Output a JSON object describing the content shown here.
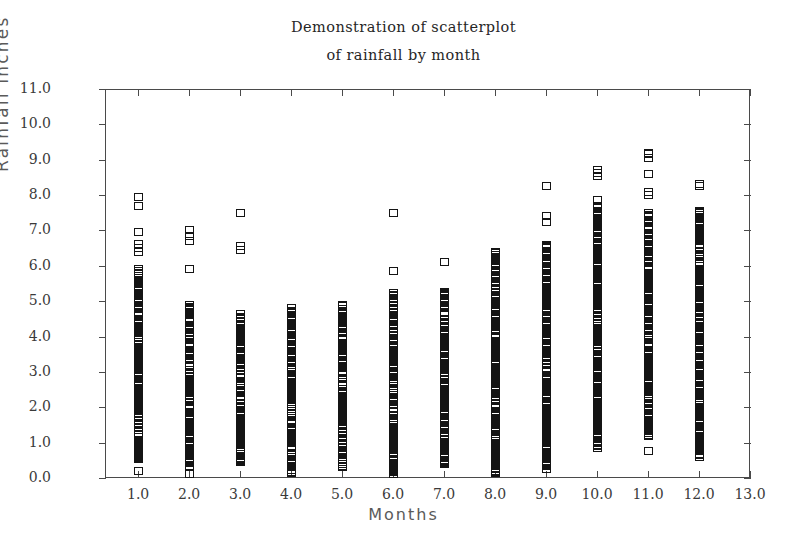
{
  "title": {
    "line1": "Demonstration of scatterplot",
    "line2": "of rainfall by month"
  },
  "axes": {
    "x_title": "Months",
    "y_title": "Rainfall inches",
    "x_ticks": [
      "1.0",
      "2.0",
      "3.0",
      "4.0",
      "5.0",
      "6.0",
      "7.0",
      "8.0",
      "9.0",
      "10.0",
      "11.0",
      "12.0",
      "13.0"
    ],
    "y_ticks": [
      "0.0",
      "1.0",
      "2.0",
      "3.0",
      "4.0",
      "5.0",
      "6.0",
      "7.0",
      "8.0",
      "9.0",
      "10.0",
      "11.0"
    ]
  },
  "style": {
    "marker": "open-square",
    "marker_color": "#141414",
    "axis_color": "#4a4a4a",
    "background": "#ffffff",
    "text_color": "#262626"
  },
  "chart_data": {
    "type": "scatter",
    "title": "Demonstration of scatterplot of rainfall by month",
    "xlabel": "Months",
    "ylabel": "Rainfall inches",
    "xlim": [
      0.35,
      13.0
    ],
    "ylim": [
      0.0,
      11.0
    ],
    "xticks": [
      1,
      2,
      3,
      4,
      5,
      6,
      7,
      8,
      9,
      10,
      11,
      12,
      13
    ],
    "yticks": [
      0,
      1,
      2,
      3,
      4,
      5,
      6,
      7,
      8,
      9,
      10,
      11
    ],
    "grid": false,
    "legend": null,
    "marker": "open-square",
    "series": [
      {
        "name": "Rainfall observations",
        "points_by_month": [
          {
            "month": 1,
            "n": 60,
            "min": 0.2,
            "max": 8.0,
            "dense_range": [
              0.5,
              5.9
            ],
            "values": [
              0.2,
              0.55,
              0.62,
              0.7,
              0.78,
              0.85,
              1.15,
              1.35,
              1.5,
              1.6,
              1.72,
              1.8,
              1.9,
              2.0,
              2.1,
              2.2,
              2.28,
              2.35,
              2.45,
              2.55,
              2.62,
              2.7,
              2.8,
              2.88,
              2.95,
              3.05,
              3.12,
              3.2,
              3.3,
              3.38,
              3.45,
              3.52,
              3.6,
              3.7,
              3.78,
              3.85,
              3.95,
              4.05,
              4.12,
              4.2,
              4.3,
              4.38,
              4.48,
              4.6,
              4.7,
              4.85,
              4.95,
              5.05,
              5.2,
              5.35,
              5.5,
              5.65,
              5.8,
              5.9,
              6.4,
              6.5,
              6.62,
              6.95,
              7.7,
              7.95
            ]
          },
          {
            "month": 2,
            "n": 57,
            "min": 0.1,
            "max": 7.0,
            "dense_range": [
              0.3,
              4.9
            ],
            "values": [
              0.1,
              0.32,
              0.42,
              0.5,
              0.62,
              0.75,
              0.9,
              1.0,
              1.1,
              1.2,
              1.3,
              1.42,
              1.55,
              1.65,
              1.75,
              1.85,
              1.95,
              2.05,
              2.15,
              2.25,
              2.32,
              2.42,
              2.5,
              2.6,
              2.7,
              2.8,
              2.88,
              2.95,
              3.05,
              3.15,
              3.25,
              3.35,
              3.45,
              3.52,
              3.6,
              3.7,
              3.8,
              3.9,
              4.0,
              4.1,
              4.2,
              4.3,
              4.4,
              4.5,
              4.6,
              4.7,
              4.8,
              4.9,
              5.9,
              6.7,
              6.85,
              7.0,
              1.48,
              2.2,
              3.0,
              3.9,
              4.45
            ]
          },
          {
            "month": 3,
            "n": 48,
            "min": 0.45,
            "max": 7.5,
            "dense_range": [
              0.45,
              4.65
            ],
            "values": [
              0.45,
              0.55,
              0.68,
              0.8,
              0.92,
              1.05,
              1.2,
              1.35,
              1.5,
              1.62,
              1.75,
              1.88,
              2.0,
              2.12,
              2.22,
              2.32,
              2.45,
              2.55,
              2.65,
              2.75,
              2.85,
              2.95,
              3.05,
              3.15,
              3.25,
              3.35,
              3.45,
              3.55,
              3.65,
              3.75,
              3.85,
              3.92,
              4.05,
              4.15,
              4.25,
              4.35,
              4.45,
              4.55,
              4.65,
              6.45,
              6.55,
              7.5,
              1.15,
              2.05,
              2.9,
              3.4,
              4.1,
              0.75
            ]
          },
          {
            "month": 4,
            "n": 55,
            "min": 0.15,
            "max": 4.8,
            "dense_range": [
              0.15,
              4.8
            ],
            "values": [
              0.15,
              0.22,
              0.3,
              0.42,
              0.55,
              0.65,
              0.78,
              0.9,
              1.0,
              1.12,
              1.22,
              1.32,
              1.45,
              1.55,
              1.65,
              1.75,
              1.85,
              1.95,
              2.05,
              2.15,
              2.25,
              2.35,
              2.45,
              2.55,
              2.65,
              2.72,
              2.82,
              2.92,
              3.0,
              3.1,
              3.2,
              3.3,
              3.4,
              3.5,
              3.6,
              3.72,
              3.78,
              4.15,
              4.25,
              4.35,
              4.45,
              4.55,
              4.7,
              4.8,
              0.5,
              1.4,
              2.2,
              2.6,
              3.05,
              3.35,
              3.65,
              1.9,
              2.48,
              2.78,
              3.15
            ]
          },
          {
            "month": 5,
            "n": 52,
            "min": 0.3,
            "max": 4.9,
            "dense_range": [
              0.3,
              4.9
            ],
            "values": [
              0.3,
              0.4,
              0.5,
              0.6,
              0.72,
              0.85,
              0.95,
              1.05,
              1.18,
              1.3,
              1.4,
              1.5,
              1.62,
              1.72,
              1.82,
              1.92,
              2.02,
              2.12,
              2.22,
              2.32,
              2.42,
              2.52,
              2.62,
              2.72,
              2.82,
              2.92,
              3.02,
              3.12,
              3.22,
              3.32,
              3.42,
              3.62,
              3.72,
              3.82,
              3.92,
              4.02,
              4.12,
              4.22,
              4.32,
              4.42,
              4.55,
              4.7,
              4.85,
              4.9,
              1.0,
              1.85,
              2.3,
              2.65,
              3.0,
              3.28,
              2.1,
              1.6
            ]
          },
          {
            "month": 6,
            "n": 58,
            "min": 0.05,
            "max": 7.5,
            "dense_range": [
              0.05,
              5.2
            ],
            "values": [
              0.05,
              0.12,
              0.22,
              0.35,
              0.48,
              0.6,
              0.72,
              0.85,
              0.98,
              1.1,
              1.22,
              1.32,
              1.45,
              1.55,
              1.65,
              1.78,
              1.88,
              1.98,
              2.08,
              2.18,
              2.3,
              2.4,
              2.5,
              2.6,
              2.7,
              2.8,
              2.9,
              3.0,
              3.1,
              3.2,
              3.3,
              3.4,
              3.5,
              3.6,
              3.72,
              3.82,
              3.95,
              4.05,
              4.2,
              4.35,
              4.5,
              4.62,
              4.75,
              4.85,
              4.95,
              5.05,
              5.15,
              5.22,
              5.85,
              7.5,
              1.7,
              2.25,
              2.95,
              3.35,
              4.1,
              0.9,
              1.5,
              2.45
            ]
          },
          {
            "month": 7,
            "n": 50,
            "min": 0.4,
            "max": 6.1,
            "dense_range": [
              0.4,
              5.25
            ],
            "values": [
              0.4,
              0.52,
              0.62,
              0.75,
              0.9,
              1.0,
              1.15,
              1.3,
              1.42,
              1.55,
              1.68,
              1.8,
              1.92,
              2.02,
              2.15,
              2.25,
              2.35,
              2.48,
              2.58,
              2.68,
              2.8,
              2.9,
              3.0,
              3.12,
              3.22,
              3.32,
              3.45,
              3.55,
              3.65,
              3.78,
              3.9,
              4.0,
              4.12,
              4.25,
              4.38,
              4.5,
              4.62,
              4.8,
              4.95,
              5.05,
              5.18,
              5.25,
              6.1,
              1.22,
              2.05,
              2.6,
              3.4,
              4.05,
              0.82,
              1.85
            ]
          },
          {
            "month": 8,
            "n": 62,
            "min": 0.15,
            "max": 6.4,
            "dense_range": [
              0.15,
              6.4
            ],
            "values": [
              0.15,
              0.28,
              0.42,
              0.55,
              0.68,
              0.8,
              0.92,
              1.05,
              1.18,
              1.3,
              1.42,
              1.55,
              1.65,
              1.78,
              1.88,
              2.0,
              2.1,
              2.22,
              2.32,
              2.45,
              2.55,
              2.65,
              2.78,
              2.88,
              2.98,
              3.08,
              3.2,
              3.3,
              3.42,
              3.52,
              3.62,
              3.75,
              3.85,
              3.98,
              4.08,
              4.2,
              4.3,
              4.42,
              4.55,
              4.68,
              4.82,
              4.95,
              5.1,
              5.25,
              5.38,
              5.55,
              5.72,
              5.85,
              6.05,
              6.15,
              6.3,
              6.4,
              1.5,
              2.4,
              3.0,
              3.6,
              4.15,
              0.95,
              2.7,
              5.0,
              1.1,
              2.85
            ]
          },
          {
            "month": 9,
            "n": 66,
            "min": 0.25,
            "max": 8.25,
            "dense_range": [
              0.25,
              6.6
            ],
            "values": [
              0.25,
              0.35,
              0.48,
              0.6,
              0.78,
              0.92,
              1.05,
              1.2,
              1.35,
              1.48,
              1.6,
              1.72,
              1.85,
              1.98,
              2.1,
              2.22,
              2.32,
              2.45,
              2.55,
              2.68,
              2.78,
              2.9,
              3.0,
              3.12,
              3.22,
              3.35,
              3.45,
              3.58,
              3.68,
              3.8,
              3.92,
              4.02,
              4.15,
              4.25,
              4.38,
              4.5,
              4.6,
              4.72,
              4.85,
              4.98,
              5.1,
              5.22,
              5.35,
              5.5,
              5.65,
              5.78,
              5.9,
              6.05,
              6.2,
              6.35,
              6.5,
              6.6,
              7.25,
              7.4,
              8.25,
              1.15,
              2.05,
              2.6,
              3.3,
              4.45,
              0.85,
              1.9,
              5.05,
              2.85,
              3.75,
              4.9
            ]
          },
          {
            "month": 10,
            "n": 70,
            "min": 0.85,
            "max": 8.7,
            "dense_range": [
              0.85,
              7.85
            ],
            "values": [
              0.85,
              0.98,
              1.12,
              1.25,
              1.38,
              1.5,
              1.62,
              1.75,
              1.88,
              2.0,
              2.12,
              2.25,
              2.35,
              2.48,
              2.58,
              2.7,
              2.82,
              2.95,
              3.05,
              3.18,
              3.3,
              3.4,
              3.52,
              3.65,
              3.75,
              3.88,
              4.0,
              4.1,
              4.22,
              4.35,
              4.45,
              4.58,
              4.7,
              4.82,
              4.95,
              5.05,
              5.18,
              5.3,
              5.42,
              5.55,
              5.68,
              5.8,
              5.92,
              6.05,
              6.18,
              6.3,
              6.42,
              6.55,
              6.68,
              6.8,
              6.95,
              7.1,
              7.25,
              7.4,
              7.55,
              7.7,
              7.85,
              8.55,
              8.62,
              8.7,
              1.45,
              2.05,
              2.65,
              3.25,
              3.95,
              4.5,
              5.1,
              5.75,
              6.25,
              7.0
            ]
          },
          {
            "month": 11,
            "n": 74,
            "min": 0.75,
            "max": 9.2,
            "dense_range": [
              1.2,
              7.5
            ],
            "values": [
              0.75,
              1.2,
              1.32,
              1.45,
              1.58,
              1.7,
              1.82,
              1.95,
              2.05,
              2.18,
              2.3,
              2.42,
              2.55,
              2.65,
              2.78,
              2.9,
              3.0,
              3.12,
              3.25,
              3.35,
              3.48,
              3.6,
              3.72,
              3.82,
              3.95,
              4.05,
              4.18,
              4.3,
              4.42,
              4.52,
              4.65,
              4.78,
              4.9,
              5.02,
              5.15,
              5.25,
              5.38,
              5.5,
              5.62,
              5.75,
              5.88,
              6.0,
              6.12,
              6.25,
              6.38,
              6.5,
              6.62,
              6.75,
              6.88,
              7.0,
              7.12,
              7.25,
              7.38,
              7.5,
              8.0,
              8.08,
              8.6,
              9.05,
              9.15,
              9.2,
              1.5,
              2.25,
              2.85,
              3.4,
              4.0,
              4.6,
              5.2,
              5.8,
              6.4,
              7.05,
              2.6,
              3.9,
              4.95,
              6.15
            ]
          },
          {
            "month": 12,
            "n": 68,
            "min": 0.6,
            "max": 8.3,
            "dense_range": [
              0.6,
              7.55
            ],
            "values": [
              0.6,
              0.75,
              0.9,
              1.05,
              1.2,
              1.35,
              1.48,
              1.6,
              1.75,
              1.88,
              2.0,
              2.12,
              2.25,
              2.38,
              2.5,
              2.62,
              2.75,
              2.88,
              3.0,
              3.12,
              3.25,
              3.38,
              3.5,
              3.62,
              3.75,
              3.88,
              4.0,
              4.12,
              4.25,
              4.38,
              4.5,
              4.62,
              4.75,
              4.88,
              5.0,
              5.12,
              5.25,
              5.38,
              5.5,
              5.62,
              5.75,
              5.88,
              6.0,
              6.12,
              6.25,
              6.38,
              6.5,
              6.62,
              6.75,
              6.88,
              7.0,
              7.12,
              7.25,
              7.38,
              7.5,
              7.55,
              8.25,
              8.3,
              1.15,
              1.95,
              2.55,
              3.3,
              4.05,
              4.7,
              5.45,
              6.05,
              6.9,
              7.2
            ]
          }
        ]
      }
    ]
  }
}
